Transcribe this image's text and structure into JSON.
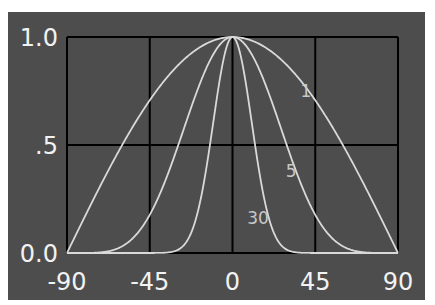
{
  "chart_data": {
    "type": "line",
    "title": "",
    "xlabel": "",
    "ylabel": "",
    "xlim": [
      -90,
      90
    ],
    "ylim": [
      0,
      1
    ],
    "grid": true,
    "x_ticks": [
      -90,
      -45,
      0,
      45,
      90
    ],
    "x_tick_labels": [
      "-90",
      "-45",
      "0",
      "45",
      "90"
    ],
    "y_ticks": [
      0,
      0.5,
      1.0
    ],
    "y_tick_labels": [
      "0.0",
      ".5",
      "1.0"
    ],
    "legend": "inline curve labels",
    "function": "cos(theta)^n",
    "x": [
      -90,
      -75,
      -60,
      -45,
      -30,
      -15,
      0,
      15,
      30,
      45,
      60,
      75,
      90
    ],
    "series": [
      {
        "name": "1",
        "label_x": 37,
        "label_y": 0.75,
        "values": [
          0,
          0.259,
          0.5,
          0.707,
          0.866,
          0.966,
          1,
          0.966,
          0.866,
          0.707,
          0.5,
          0.259,
          0
        ]
      },
      {
        "name": "5",
        "label_x": 29,
        "label_y": 0.38,
        "values": [
          0,
          0.001,
          0.031,
          0.177,
          0.487,
          0.84,
          1,
          0.84,
          0.487,
          0.177,
          0.031,
          0.001,
          0
        ]
      },
      {
        "name": "30",
        "label_x": 8,
        "label_y": 0.16,
        "values": [
          0,
          0,
          0,
          0,
          0.013,
          0.353,
          1,
          0.353,
          0.013,
          0,
          0,
          0,
          0
        ]
      }
    ],
    "colors": {
      "background": "#4d4d4d",
      "grid": "#000000",
      "curve": "#d9d9d9",
      "text": "#f2f2f2",
      "curve_label": "#c8c8c8"
    }
  }
}
